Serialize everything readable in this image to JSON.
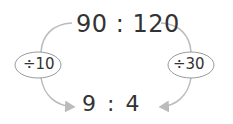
{
  "diagram": {
    "top_ratio": "90 : 120",
    "bottom_ratio": "9 : 4",
    "left_operation": "÷10",
    "right_operation": "÷30",
    "colors": {
      "text": "#333333",
      "arrow": "#bbbbbb",
      "ellipse_border": "#999999"
    }
  }
}
